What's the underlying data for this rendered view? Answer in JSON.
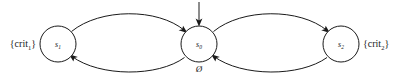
{
  "diagram": {
    "type": "state-transition-diagram",
    "title": "",
    "background_color": "#ffffff",
    "line_color": "#1a1a1a",
    "states": [
      {
        "id": "s1",
        "label": "s",
        "subscript": "1",
        "cx": 58,
        "cy": 44,
        "r": 18,
        "proposition_label": "{crit",
        "proposition_subscript": "1",
        "proposition_close": "}",
        "proposition_side": "left",
        "is_initial": false
      },
      {
        "id": "s0",
        "label": "s",
        "subscript": "0",
        "cx": 199,
        "cy": 44,
        "r": 18,
        "proposition_label": "Ø",
        "proposition_subscript": "",
        "proposition_close": "",
        "proposition_side": "below",
        "is_initial": true
      },
      {
        "id": "s2",
        "label": "s",
        "subscript": "2",
        "cx": 341,
        "cy": 44,
        "r": 18,
        "proposition_label": "{crit",
        "proposition_subscript": "2",
        "proposition_close": "}",
        "proposition_side": "right",
        "is_initial": false
      }
    ],
    "transitions": [
      {
        "id": "t-s1-to-s0",
        "from": "s1",
        "to": "s0",
        "curve": "upper",
        "label": ""
      },
      {
        "id": "t-s0-to-s1",
        "from": "s0",
        "to": "s1",
        "curve": "lower",
        "label": ""
      },
      {
        "id": "t-s0-to-s2",
        "from": "s0",
        "to": "s2",
        "curve": "upper",
        "label": ""
      },
      {
        "id": "t-s2-to-s0",
        "from": "s2",
        "to": "s0",
        "curve": "lower",
        "label": ""
      }
    ],
    "initial_marker": {
      "id": "initial-arrow",
      "target": "s0",
      "from_x": 199,
      "from_y": 2,
      "to_x": 199,
      "to_y": 26
    }
  }
}
